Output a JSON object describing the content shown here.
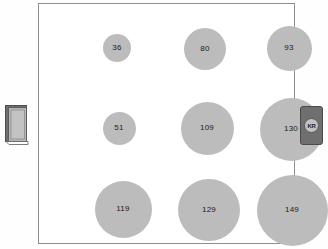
{
  "frame": {
    "border_color": "#8e8e8e",
    "background": "#ffffff"
  },
  "left_icon": {
    "name": "book-icon",
    "cover_color": "#b7b7b7",
    "spine_color": "#6e6e6e"
  },
  "right_badge": {
    "name": "kr-badge",
    "label": "KR",
    "background": "#6f6f6f",
    "disc_color": "#c2c2c2"
  },
  "chart_data": {
    "type": "scatter",
    "title": "",
    "subtitle": "",
    "xlabel": "",
    "ylabel": "",
    "grid": false,
    "legend": "none",
    "bubble_color": "#bcbcbc",
    "columns": [
      "col-1",
      "col-2",
      "col-3"
    ],
    "rows": [
      "row-1",
      "row-2",
      "row-3"
    ],
    "points": [
      {
        "row": 0,
        "col": 0,
        "value": 36,
        "label": "36",
        "cx": 78,
        "cy": 44,
        "r": 14.0
      },
      {
        "row": 0,
        "col": 1,
        "value": 80,
        "label": "80",
        "cx": 166,
        "cy": 45,
        "r": 21.0
      },
      {
        "row": 0,
        "col": 2,
        "value": 93,
        "label": "93",
        "cx": 250,
        "cy": 44,
        "r": 22.5
      },
      {
        "row": 1,
        "col": 0,
        "value": 51,
        "label": "51",
        "cx": 80,
        "cy": 124,
        "r": 16.5
      },
      {
        "row": 1,
        "col": 1,
        "value": 109,
        "label": "109",
        "cx": 168,
        "cy": 124,
        "r": 26.5
      },
      {
        "row": 1,
        "col": 2,
        "value": 130,
        "label": "130",
        "cx": 252,
        "cy": 125,
        "r": 31.5
      },
      {
        "row": 2,
        "col": 0,
        "value": 119,
        "label": "119",
        "cx": 84,
        "cy": 205,
        "r": 28.5
      },
      {
        "row": 2,
        "col": 1,
        "value": 129,
        "label": "129",
        "cx": 170,
        "cy": 206,
        "r": 31.0
      },
      {
        "row": 2,
        "col": 2,
        "value": 149,
        "label": "149",
        "cx": 253,
        "cy": 206,
        "r": 35.5
      }
    ],
    "values": [
      36,
      80,
      93,
      51,
      109,
      130,
      119,
      129,
      149
    ],
    "value_min": 36,
    "value_max": 149
  }
}
